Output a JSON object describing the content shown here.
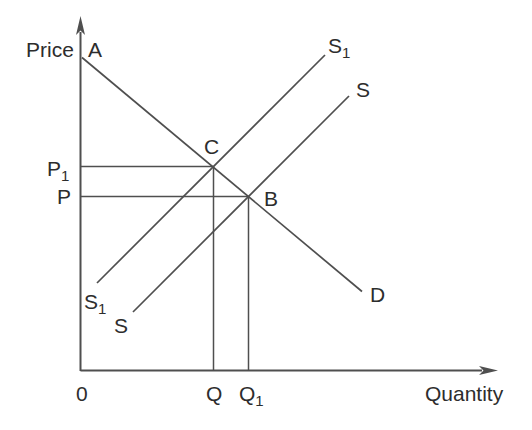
{
  "figure": {
    "kind": "supply-demand-diagram",
    "colors": {
      "background": "#ffffff",
      "line": "#4f4f4f",
      "text": "#2d2d2d"
    }
  },
  "axes": {
    "y_axis_label": "Price",
    "x_axis_label": "Quantity",
    "origin_label": "0"
  },
  "diagram": {
    "curves": [
      {
        "name": "demand",
        "endpoint_labels": [
          "A",
          "D"
        ],
        "slope": "downward"
      },
      {
        "name": "supply-s1",
        "endpoint_labels": [
          "S1",
          "S1"
        ],
        "slope": "upward"
      },
      {
        "name": "supply-s",
        "endpoint_labels": [
          "S",
          "S"
        ],
        "slope": "upward"
      }
    ],
    "intersections": [
      {
        "label": "C",
        "price_label": "P1",
        "quantity_label": "Q"
      },
      {
        "label": "B",
        "price_label": "P",
        "quantity_label": "Q1"
      }
    ]
  },
  "labels": {
    "price": {
      "text": "Price",
      "sub": "",
      "x": 26,
      "y": 57,
      "anchor": "start"
    },
    "a": {
      "text": "A",
      "sub": "",
      "x": 88,
      "y": 57,
      "anchor": "start"
    },
    "s1_top": {
      "text": "S",
      "sub": "1",
      "x": 328,
      "y": 53,
      "anchor": "start"
    },
    "s_top": {
      "text": "S",
      "sub": "",
      "x": 356,
      "y": 97,
      "anchor": "start"
    },
    "c": {
      "text": "C",
      "sub": "",
      "x": 204,
      "y": 154,
      "anchor": "start"
    },
    "p1": {
      "text": "P",
      "sub": "1",
      "x": 47,
      "y": 176,
      "anchor": "start"
    },
    "p": {
      "text": "P",
      "sub": "",
      "x": 57,
      "y": 204,
      "anchor": "start"
    },
    "b": {
      "text": "B",
      "sub": "",
      "x": 264,
      "y": 206,
      "anchor": "start"
    },
    "s1_bottom": {
      "text": "S",
      "sub": "1",
      "x": 84,
      "y": 309,
      "anchor": "start"
    },
    "s_bottom": {
      "text": "S",
      "sub": "",
      "x": 114,
      "y": 333,
      "anchor": "start"
    },
    "d": {
      "text": "D",
      "sub": "",
      "x": 370,
      "y": 302,
      "anchor": "start"
    },
    "origin": {
      "text": "0",
      "sub": "",
      "x": 76,
      "y": 401,
      "anchor": "start"
    },
    "q": {
      "text": "Q",
      "sub": "",
      "x": 206,
      "y": 401,
      "anchor": "start"
    },
    "q1": {
      "text": "Q",
      "sub": "1",
      "x": 239,
      "y": 401,
      "anchor": "start"
    },
    "quantity": {
      "text": "Quantity",
      "sub": "",
      "x": 425,
      "y": 401,
      "anchor": "start"
    }
  },
  "lines": {
    "y_axis": {
      "x1": 80.5,
      "y1": 371,
      "x2": 80.5,
      "y2": 32
    },
    "x_axis": {
      "x1": 80.5,
      "y1": 370.5,
      "x2": 482,
      "y2": 370.5
    },
    "demand": {
      "x1": 82,
      "y1": 57.5,
      "x2": 362,
      "y2": 291.5
    },
    "supply_s1": {
      "x1": 97,
      "y1": 283,
      "x2": 325,
      "y2": 55
    },
    "supply_s": {
      "x1": 133,
      "y1": 312,
      "x2": 349,
      "y2": 96
    },
    "p1_guide": {
      "x1": 80.5,
      "y1": 166.5,
      "x2": 213.5,
      "y2": 166.5
    },
    "p_guide": {
      "x1": 80.5,
      "y1": 196.5,
      "x2": 248.5,
      "y2": 196.5
    },
    "q_guide": {
      "x1": 213.5,
      "y1": 166.5,
      "x2": 213.5,
      "y2": 370.5
    },
    "q1_guide": {
      "x1": 248.5,
      "y1": 196.5,
      "x2": 248.5,
      "y2": 370.5
    }
  },
  "arrows": {
    "y_axis_arrow": "80.5,16 76,35 80.5,30.5 85,35",
    "x_axis_arrow": "498,370.5 479,366 483.5,370.5 479,375"
  }
}
